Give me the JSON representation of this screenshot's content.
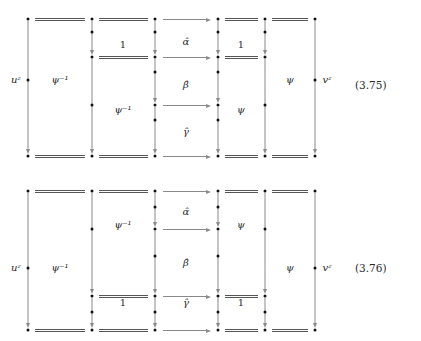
{
  "document": {
    "kind": "commutative-diagram-figure",
    "diagrams": [
      {
        "id": "3.75",
        "equation_number": "(3.75)",
        "outer_left_label": "uᶻ",
        "outer_right_label": "vᶻ",
        "cell_labels": [
          {
            "text": "ψ⁻¹",
            "x": 60,
            "y": 80
          },
          {
            "text": "1",
            "x": 123,
            "y": 45
          },
          {
            "text": "ψ⁻¹",
            "x": 123,
            "y": 110
          },
          {
            "text": "α̂",
            "x": 186,
            "y": 42
          },
          {
            "text": "β̂",
            "x": 186,
            "y": 85
          },
          {
            "text": "γ̂",
            "x": 186,
            "y": 132
          },
          {
            "text": "1",
            "x": 241,
            "y": 45
          },
          {
            "text": "ψ",
            "x": 241,
            "y": 110
          },
          {
            "text": "ψ",
            "x": 290,
            "y": 80
          }
        ]
      },
      {
        "id": "3.76",
        "equation_number": "(3.76)",
        "outer_left_label": "uᶻ",
        "outer_right_label": "vᶻ",
        "cell_labels": [
          {
            "text": "ψ⁻¹",
            "x": 60,
            "y": 98
          },
          {
            "text": "ψ⁻¹",
            "x": 123,
            "y": 55
          },
          {
            "text": "1",
            "x": 123,
            "y": 133
          },
          {
            "text": "α̂",
            "x": 186,
            "y": 42
          },
          {
            "text": "β̂",
            "x": 186,
            "y": 93
          },
          {
            "text": "γ̂",
            "x": 186,
            "y": 133
          },
          {
            "text": "ψ",
            "x": 241,
            "y": 55
          },
          {
            "text": "1",
            "x": 241,
            "y": 133
          },
          {
            "text": "ψ",
            "x": 290,
            "y": 98
          }
        ]
      }
    ],
    "glyphs": {
      "psi": "ψ",
      "psi_inverse": "ψ⁻¹",
      "alpha_hat": "α̂",
      "beta_hat": "β̂",
      "gamma_hat": "γ̂",
      "one": "1",
      "u_z": "uᶻ",
      "v_z": "vᶻ"
    },
    "colors": {
      "ink": "#1a1a1a",
      "arrow": "#8a8a8a",
      "rule": "#555555",
      "background": "#ffffff"
    }
  },
  "geometry": {
    "columns_x": [
      28,
      92,
      155,
      218,
      265,
      315
    ],
    "diagram1": {
      "rows_y": [
        19,
        57,
        105,
        156
      ],
      "node_rows": {
        "c0": [
          19,
          80,
          156
        ],
        "c1": [
          19,
          32,
          57,
          105,
          156
        ],
        "c2": [
          19,
          32,
          57,
          72,
          105,
          120,
          156
        ],
        "c3": [
          19,
          32,
          57,
          72,
          105,
          120,
          156
        ],
        "c4": [
          19,
          32,
          57,
          105,
          156
        ],
        "c5": [
          19,
          80,
          156
        ]
      },
      "double_lines": [
        {
          "row": 19,
          "from": 0,
          "to": 1
        },
        {
          "row": 19,
          "from": 1,
          "to": 2
        },
        {
          "row": 19,
          "from": 3,
          "to": 4
        },
        {
          "row": 19,
          "from": 4,
          "to": 5
        },
        {
          "row": 57,
          "from": 1,
          "to": 2
        },
        {
          "row": 57,
          "from": 3,
          "to": 4
        },
        {
          "row": 156,
          "from": 0,
          "to": 1
        },
        {
          "row": 156,
          "from": 1,
          "to": 2
        },
        {
          "row": 156,
          "from": 3,
          "to": 4
        },
        {
          "row": 156,
          "from": 4,
          "to": 5
        }
      ],
      "h_arrows": [
        {
          "row": 19,
          "from": 2,
          "to": 3
        },
        {
          "row": 57,
          "from": 2,
          "to": 3
        },
        {
          "row": 105,
          "from": 2,
          "to": 3
        },
        {
          "row": 156,
          "from": 2,
          "to": 3
        }
      ],
      "v_arrows": [
        {
          "col": 0,
          "from": 19,
          "to": 156
        },
        {
          "col": 1,
          "from": 19,
          "to": 57
        },
        {
          "col": 1,
          "from": 57,
          "to": 156
        },
        {
          "col": 2,
          "from": 19,
          "to": 57
        },
        {
          "col": 2,
          "from": 57,
          "to": 105
        },
        {
          "col": 2,
          "from": 105,
          "to": 156
        },
        {
          "col": 3,
          "from": 19,
          "to": 57
        },
        {
          "col": 3,
          "from": 57,
          "to": 105
        },
        {
          "col": 3,
          "from": 105,
          "to": 156
        },
        {
          "col": 4,
          "from": 19,
          "to": 57
        },
        {
          "col": 4,
          "from": 57,
          "to": 156
        },
        {
          "col": 5,
          "from": 19,
          "to": 156
        }
      ]
    },
    "diagram2": {
      "rows_y": [
        21,
        59,
        126,
        160
      ],
      "node_rows": {
        "c0": [
          21,
          98,
          160
        ],
        "c1": [
          21,
          59,
          126,
          142,
          160
        ],
        "c2": [
          21,
          37,
          59,
          86,
          126,
          142,
          160
        ],
        "c3": [
          21,
          37,
          59,
          86,
          126,
          142,
          160
        ],
        "c4": [
          21,
          59,
          126,
          142,
          160
        ],
        "c5": [
          21,
          98,
          160
        ]
      },
      "double_lines": [
        {
          "row": 21,
          "from": 0,
          "to": 1
        },
        {
          "row": 21,
          "from": 1,
          "to": 2
        },
        {
          "row": 21,
          "from": 3,
          "to": 4
        },
        {
          "row": 21,
          "from": 4,
          "to": 5
        },
        {
          "row": 126,
          "from": 1,
          "to": 2
        },
        {
          "row": 126,
          "from": 3,
          "to": 4
        },
        {
          "row": 160,
          "from": 0,
          "to": 1
        },
        {
          "row": 160,
          "from": 1,
          "to": 2
        },
        {
          "row": 160,
          "from": 3,
          "to": 4
        },
        {
          "row": 160,
          "from": 4,
          "to": 5
        }
      ],
      "h_arrows": [
        {
          "row": 21,
          "from": 2,
          "to": 3
        },
        {
          "row": 59,
          "from": 2,
          "to": 3
        },
        {
          "row": 126,
          "from": 2,
          "to": 3
        },
        {
          "row": 160,
          "from": 2,
          "to": 3
        }
      ],
      "v_arrows": [
        {
          "col": 0,
          "from": 21,
          "to": 160
        },
        {
          "col": 1,
          "from": 21,
          "to": 126
        },
        {
          "col": 1,
          "from": 126,
          "to": 160
        },
        {
          "col": 2,
          "from": 21,
          "to": 59
        },
        {
          "col": 2,
          "from": 59,
          "to": 126
        },
        {
          "col": 2,
          "from": 126,
          "to": 160
        },
        {
          "col": 3,
          "from": 21,
          "to": 59
        },
        {
          "col": 3,
          "from": 59,
          "to": 126
        },
        {
          "col": 3,
          "from": 126,
          "to": 160
        },
        {
          "col": 4,
          "from": 21,
          "to": 126
        },
        {
          "col": 4,
          "from": 126,
          "to": 160
        },
        {
          "col": 5,
          "from": 21,
          "to": 160
        }
      ]
    },
    "outer_labels": {
      "diagram1": [
        {
          "text_key": "outer_left_label",
          "x": 16,
          "y": 80
        },
        {
          "text_key": "outer_right_label",
          "x": 327,
          "y": 80
        }
      ],
      "diagram2": [
        {
          "text_key": "outer_left_label",
          "x": 16,
          "y": 98
        },
        {
          "text_key": "outer_right_label",
          "x": 327,
          "y": 98
        }
      ]
    },
    "eqnum_pos": {
      "x": 355,
      "d1_y": 85,
      "d2_y": 98
    }
  }
}
